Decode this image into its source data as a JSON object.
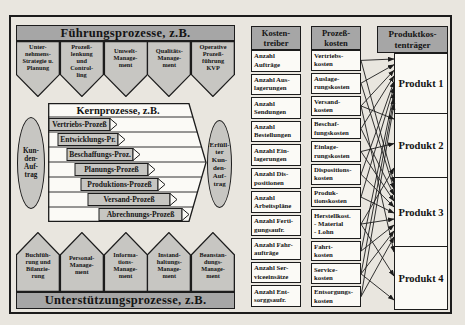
{
  "palette": {
    "page_bg": "#e9e6df",
    "header_gray": "#a6a6a6",
    "shape_gray": "#c7c6c2",
    "box_white": "#fbfaf6",
    "line_black": "#1c1c1c"
  },
  "fuehrung": {
    "title": "Führungsprozesse, z.B.",
    "shapes": [
      "Unter-\nnehmens-\nStrategie u.\nPlanung",
      "Prozeß-\nlenkung\nund\nControl-\nling",
      "Umwelt-\nManage-\nment",
      "Qualitäts-\nManage-\nment",
      "Operative\nProzeß-\nführung\nKVP"
    ]
  },
  "kern": {
    "title": "Kernprozesse, z.B.",
    "processes": [
      "Vertriebs-Prozeß",
      "Entwicklungs-Pr.",
      "Beschaffungs-Proz.",
      "Planungs-Prozeß",
      "Produktions-Prozeß",
      "Versand-Prozeß",
      "Abrechnungs-Prozeß"
    ],
    "input": "Kun-\nden-\nAuf-\ntrag",
    "output": "Erfüll-\nter\nKun-\nden-\nAuf-\ntrag"
  },
  "unterstuetzung": {
    "title": "Unterstützungsprozesse, z.B.",
    "shapes": [
      "Buchfüh-\nrung und\nBilanzie-\nrung",
      "Personal-\nManage-\nment",
      "Informa-\ntions-\nManage-\nment",
      "Instand-\nhaltungs-\nManage-\nment",
      "Beanstan-\ndungs-\nManage-\nment"
    ]
  },
  "kostentreiber": {
    "title": "Kosten-\ntreiber",
    "items": [
      "Anzahl\nAufträge",
      "Anzahl Aus-\nlagerungen",
      "Anzahl\nSendungen",
      "Anzahl\nBestellungen",
      "Anzahl Ein-\nlagerungen",
      "Anzahl Dis-\npositionen",
      "Anzahl\nArbeitspläne",
      "Anzahl Ferti-\ngungsaufr.",
      "Anzahl Fahr-\naufträge",
      "Anzahl Ser-\nviceeinsätze",
      "Anzahl Ent-\nsorggsaufr."
    ]
  },
  "prozesskosten": {
    "title": "Prozeß-\nkosten",
    "items": [
      "Vertriebs-\nkosten",
      "Auslage-\nrungskosten",
      "Versand-\nkosten",
      "Beschaf-\nfungskosten",
      "Einlage-\nrungskosten",
      "Dispositions-\nkosten",
      "Produk-\ntionskosten",
      "Herstellkost.\n- Material\n- Lohn",
      "Fahrt-\nkosten",
      "Service-\nkosten",
      "Entsorgungs-\nkosten"
    ]
  },
  "produkte": {
    "title": "Produktkos-\ntenträger",
    "items": [
      "Produkt 1",
      "Produkt 2",
      "Produkt 3",
      "Produkt 4"
    ]
  },
  "connections": [
    [
      1,
      1
    ],
    [
      2,
      1
    ],
    [
      3,
      1
    ],
    [
      4,
      1
    ],
    [
      6,
      1
    ],
    [
      7,
      1
    ],
    [
      9,
      1
    ],
    [
      10,
      1
    ],
    [
      11,
      1
    ],
    [
      3,
      2
    ],
    [
      5,
      2
    ],
    [
      8,
      2
    ],
    [
      1,
      3
    ],
    [
      2,
      3
    ],
    [
      4,
      3
    ],
    [
      5,
      3
    ],
    [
      6,
      3
    ],
    [
      7,
      3
    ],
    [
      8,
      3
    ],
    [
      9,
      3
    ],
    [
      10,
      3
    ],
    [
      11,
      3
    ],
    [
      3,
      4
    ],
    [
      8,
      4
    ],
    [
      10,
      4
    ]
  ]
}
